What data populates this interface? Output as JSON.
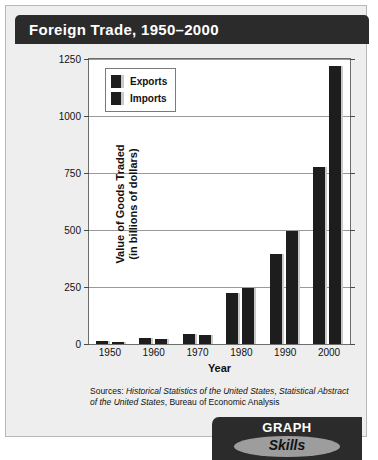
{
  "title": "Foreign Trade, 1950–2000",
  "badge": {
    "top": "GRAPH",
    "bottom": "Skills"
  },
  "sources": {
    "prefix": "Sources: ",
    "italic1": "Historical Statistics of the United States",
    "mid1": ", ",
    "italic2": "Statistical Abstract of the United States",
    "suffix": ", Bureau of Economic Analysis"
  },
  "chart_data": {
    "type": "bar",
    "title": "Foreign Trade, 1950–2000",
    "xlabel": "Year",
    "ylabel": "Value of  Goods Traded (in billions of dollars)",
    "ylabel_line1": "Value of  Goods Traded",
    "ylabel_line2": "(in billions of dollars)",
    "categories": [
      "1950",
      "1960",
      "1970",
      "1980",
      "1990",
      "2000"
    ],
    "series": [
      {
        "name": "Exports",
        "values": [
          12,
          26,
          43,
          225,
          395,
          775
        ]
      },
      {
        "name": "Imports",
        "values": [
          9,
          22,
          40,
          245,
          495,
          1220
        ]
      }
    ],
    "ylim": [
      0,
      1250
    ],
    "yticks": [
      0,
      250,
      500,
      750,
      1000,
      1250
    ],
    "ytick_labels": [
      "0",
      "250",
      "500",
      "750",
      "1000",
      "1250"
    ],
    "grid": true,
    "legend_position": "top-left",
    "bar_color": "#1d1d1d",
    "bar_edge_color": "#c9c9c9"
  }
}
